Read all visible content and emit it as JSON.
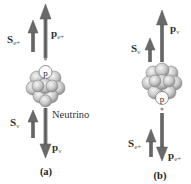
{
  "diagram": {
    "panels": [
      {
        "caption": "(a)",
        "labels": {
          "spin_positron": {
            "main": "S",
            "sub": "e+"
          },
          "momentum_positron": {
            "main": "p",
            "sub": "e+"
          },
          "spin_neutrino": {
            "main": "S",
            "sub": "ν"
          },
          "momentum_neutrino": {
            "main": "p",
            "sub": "ν"
          },
          "particle": "Neutrino",
          "proton": "p"
        }
      },
      {
        "caption": "(b)",
        "labels": {
          "spin_neutrino": {
            "main": "S",
            "sub": "ν"
          },
          "momentum_neutrino": {
            "main": "p",
            "sub": "ν"
          },
          "spin_positron": {
            "main": "S",
            "sub": "e+"
          },
          "momentum_positron": {
            "main": "p",
            "sub": "e+"
          },
          "proton": "p"
        }
      }
    ],
    "colors": {
      "arrow": "#6b6b6b",
      "arrow_dark": "#4a4a4a",
      "nucleus_light": "#e0e0e0",
      "nucleus_mid": "#bdbdbd",
      "nucleus_dark": "#8a8a8a"
    }
  }
}
